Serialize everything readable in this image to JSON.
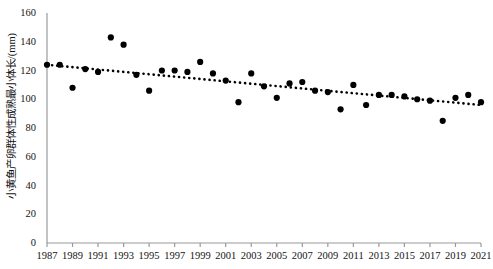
{
  "chart_data": {
    "type": "scatter",
    "title": "",
    "subtitle": "",
    "xlabel": "",
    "ylabel": "小黄鱼产卵群体性成熟最小体长/(mm)",
    "xlim": [
      1987,
      2021
    ],
    "ylim": [
      0,
      160
    ],
    "grid": false,
    "legend": null,
    "x_ticks": [
      "1987",
      "1989",
      "1991",
      "1993",
      "1995",
      "1997",
      "1999",
      "2001",
      "2003",
      "2005",
      "2007",
      "2009",
      "2011",
      "2013",
      "2015",
      "2017",
      "2019",
      "2021"
    ],
    "x_tick_values": [
      1987,
      1989,
      1991,
      1993,
      1995,
      1997,
      1999,
      2001,
      2003,
      2005,
      2007,
      2009,
      2011,
      2013,
      2015,
      2017,
      2019,
      2021
    ],
    "y_ticks": [
      "0",
      "20",
      "40",
      "60",
      "80",
      "100",
      "120",
      "140",
      "160"
    ],
    "y_tick_values": [
      0,
      20,
      40,
      60,
      80,
      100,
      120,
      140,
      160
    ],
    "marker": "filled-circle",
    "marker_color": "#000000",
    "x": [
      1987,
      1988,
      1989,
      1990,
      1991,
      1992,
      1993,
      1994,
      1995,
      1996,
      1997,
      1998,
      1999,
      2000,
      2001,
      2002,
      2003,
      2004,
      2005,
      2006,
      2007,
      2008,
      2009,
      2010,
      2011,
      2012,
      2013,
      2014,
      2015,
      2016,
      2017,
      2018,
      2019,
      2020,
      2021
    ],
    "values": [
      124,
      124,
      108,
      121,
      119,
      143,
      138,
      117,
      106,
      120,
      120,
      119,
      126,
      118,
      113,
      98,
      118,
      109,
      101,
      111,
      112,
      106,
      105,
      93,
      110,
      96,
      103,
      103,
      102,
      100,
      99,
      85,
      101,
      103,
      98
    ],
    "series": [
      {
        "name": "小黄鱼性成熟最小体长",
        "type": "scatter",
        "points": [
          {
            "x": 1987,
            "y": 124
          },
          {
            "x": 1988,
            "y": 124
          },
          {
            "x": 1989,
            "y": 108
          },
          {
            "x": 1990,
            "y": 121
          },
          {
            "x": 1991,
            "y": 119
          },
          {
            "x": 1992,
            "y": 143
          },
          {
            "x": 1993,
            "y": 138
          },
          {
            "x": 1994,
            "y": 117
          },
          {
            "x": 1995,
            "y": 106
          },
          {
            "x": 1996,
            "y": 120
          },
          {
            "x": 1997,
            "y": 120
          },
          {
            "x": 1998,
            "y": 119
          },
          {
            "x": 1999,
            "y": 126
          },
          {
            "x": 2000,
            "y": 118
          },
          {
            "x": 2001,
            "y": 113
          },
          {
            "x": 2002,
            "y": 98
          },
          {
            "x": 2003,
            "y": 118
          },
          {
            "x": 2004,
            "y": 109
          },
          {
            "x": 2005,
            "y": 101
          },
          {
            "x": 2006,
            "y": 111
          },
          {
            "x": 2007,
            "y": 112
          },
          {
            "x": 2008,
            "y": 106
          },
          {
            "x": 2009,
            "y": 105
          },
          {
            "x": 2010,
            "y": 93
          },
          {
            "x": 2011,
            "y": 110
          },
          {
            "x": 2012,
            "y": 96
          },
          {
            "x": 2013,
            "y": 103
          },
          {
            "x": 2014,
            "y": 103
          },
          {
            "x": 2015,
            "y": 102
          },
          {
            "x": 2016,
            "y": 100
          },
          {
            "x": 2017,
            "y": 99
          },
          {
            "x": 2018,
            "y": 85
          },
          {
            "x": 2019,
            "y": 101
          },
          {
            "x": 2020,
            "y": 103
          },
          {
            "x": 2021,
            "y": 98
          }
        ]
      },
      {
        "name": "趋势线",
        "type": "line",
        "style": "dotted",
        "color": "#000000",
        "endpoints": [
          {
            "x": 1987,
            "y": 124
          },
          {
            "x": 2021,
            "y": 96
          }
        ]
      }
    ]
  }
}
